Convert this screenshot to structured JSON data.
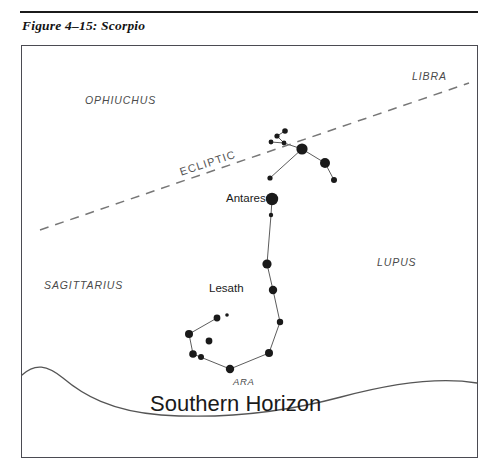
{
  "figure": {
    "caption": "Figure 4–15: Scorpio",
    "constellation": "Scorpio"
  },
  "chart_data": {
    "type": "scatter",
    "title": "Figure 4–15: Scorpio",
    "xlabel": "",
    "ylabel": "",
    "xlim": [
      0,
      457
    ],
    "ylim": [
      0,
      413
    ],
    "grid": false,
    "legend": null,
    "stars": [
      {
        "id": "head-a",
        "x": 256,
        "y": 91,
        "r": 2.6,
        "label": ""
      },
      {
        "id": "head-b",
        "x": 264,
        "y": 86,
        "r": 2.8,
        "label": ""
      },
      {
        "id": "head-c",
        "x": 263,
        "y": 98,
        "r": 2.4,
        "label": ""
      },
      {
        "id": "head-d",
        "x": 250,
        "y": 97,
        "r": 2.4,
        "label": ""
      },
      {
        "id": "graffias",
        "x": 281,
        "y": 104,
        "r": 5.6,
        "label": ""
      },
      {
        "id": "dschubba",
        "x": 304,
        "y": 118,
        "r": 5.0,
        "label": ""
      },
      {
        "id": "pi-sco",
        "x": 313,
        "y": 135,
        "r": 3.0,
        "label": ""
      },
      {
        "id": "rho-sco",
        "x": 249,
        "y": 133,
        "r": 2.6,
        "label": ""
      },
      {
        "id": "antares",
        "x": 251,
        "y": 154,
        "r": 6.2,
        "label": "Antares"
      },
      {
        "id": "tau-sco",
        "x": 250,
        "y": 170,
        "r": 2.2,
        "label": ""
      },
      {
        "id": "epsilon-sco",
        "x": 246,
        "y": 219,
        "r": 4.6,
        "label": ""
      },
      {
        "id": "mu-sco",
        "x": 252,
        "y": 245,
        "r": 4.2,
        "label": ""
      },
      {
        "id": "zeta-sco",
        "x": 259,
        "y": 277,
        "r": 3.2,
        "label": ""
      },
      {
        "id": "eta-sco",
        "x": 248,
        "y": 308,
        "r": 4.0,
        "label": ""
      },
      {
        "id": "theta-sco",
        "x": 209,
        "y": 324,
        "r": 4.2,
        "label": ""
      },
      {
        "id": "iota-sco",
        "x": 172,
        "y": 309,
        "r": 3.8,
        "label": ""
      },
      {
        "id": "kappa-sco",
        "x": 168,
        "y": 289,
        "r": 4.0,
        "label": ""
      },
      {
        "id": "lesath",
        "x": 196,
        "y": 273,
        "r": 3.4,
        "label": "Lesath"
      },
      {
        "id": "shaula",
        "x": 206,
        "y": 270,
        "r": 1.8,
        "label": ""
      },
      {
        "id": "g-sco",
        "x": 188,
        "y": 296,
        "r": 3.4,
        "label": ""
      },
      {
        "id": "q-sco",
        "x": 180,
        "y": 312,
        "r": 3.0,
        "label": ""
      }
    ],
    "star_links": [
      [
        "head-d",
        "head-c"
      ],
      [
        "head-c",
        "head-a"
      ],
      [
        "head-a",
        "head-b"
      ],
      [
        "head-c",
        "graffias"
      ],
      [
        "graffias",
        "dschubba"
      ],
      [
        "dschubba",
        "pi-sco"
      ],
      [
        "graffias",
        "rho-sco"
      ],
      [
        "antares",
        "tau-sco"
      ],
      [
        "tau-sco",
        "epsilon-sco"
      ],
      [
        "epsilon-sco",
        "mu-sco"
      ],
      [
        "mu-sco",
        "zeta-sco"
      ],
      [
        "zeta-sco",
        "eta-sco"
      ],
      [
        "eta-sco",
        "theta-sco"
      ],
      [
        "theta-sco",
        "iota-sco"
      ],
      [
        "iota-sco",
        "kappa-sco"
      ],
      [
        "kappa-sco",
        "lesath"
      ]
    ]
  },
  "labels": {
    "ophiuchus": "OPHIUCHUS",
    "libra": "LIBRA",
    "sagittarius": "SAGITTARIUS",
    "lupus": "LUPUS",
    "ara": "ARA",
    "ecliptic": "ECLIPTIC",
    "antares": "Antares",
    "lesath": "Lesath",
    "southern_horizon": "Southern Horizon"
  },
  "colors": {
    "star_fill": "#1a1a1a",
    "line": "#4a4a4a",
    "ecliptic": "#777777",
    "frame": "#4b4b52",
    "text": "#1a1a1a",
    "label_text": "#4a4a4a",
    "background": "#ffffff"
  }
}
